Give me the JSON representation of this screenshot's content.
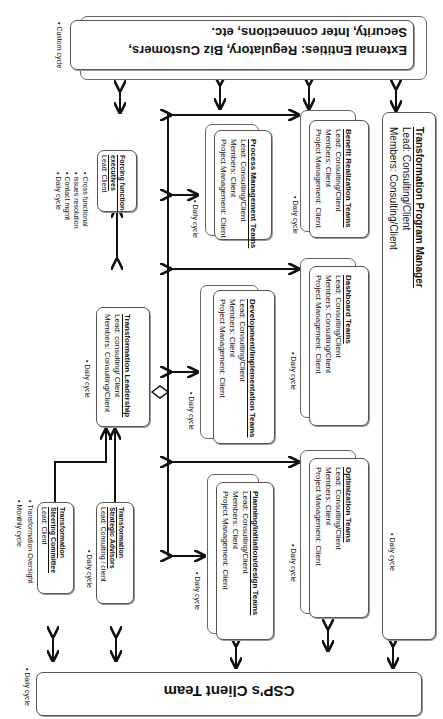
{
  "external": {
    "line1": "External Entities: Regulatory,  Biz Customers,",
    "line2": "Security, Inter connections, etc.",
    "cycle": "Custom cycle"
  },
  "client_team": {
    "title": "CSP's Client Team",
    "cycle": "Daily cycle"
  },
  "forcing": {
    "title1": "Forcing function-",
    "title2": "executives",
    "lead": "Lead: Client",
    "notes": [
      "Cross functional",
      "issues resolution",
      "Contact mgmt",
      "Daily cycle"
    ]
  },
  "leadership": {
    "title": "Transformation Leadership",
    "lead": "Lead: consulting/ Client",
    "members": "Members: Consulting/Client",
    "cycle": "Daily cycle"
  },
  "steering": {
    "title1": "Transformation",
    "title2": "Steering Committee",
    "lead": "Lead: Client",
    "notes": [
      "Transformation Oversight",
      "Monthly cycle"
    ]
  },
  "advisors": {
    "title1": "Transformation",
    "title2": "Strategic Advisors",
    "lead": "Lead: Consulting / client",
    "cycle": "Daily cycle"
  },
  "teams": [
    {
      "title": "Process Management  Teams",
      "lead": "Lead:  Consulting/Client",
      "members": "Members: Client",
      "pm": "Project Management: Client",
      "cycle": "Daily cycle"
    },
    {
      "title": "Development/Implementation Teams",
      "lead": "Lead:  Consulting/Client",
      "members": "Members: Client",
      "pm": "Project Management: Client",
      "cycle": "Daily cycle"
    },
    {
      "title": "Planning/initiation/design Teams",
      "lead": "Lead: Consulting/Client",
      "members": "Members: Client",
      "pm": "Project Management: Client",
      "cycle": "Daily cycle"
    },
    {
      "title": "Benefit Realization Teams",
      "lead": "Lead:  Consulting/Client",
      "members": "Members: Client",
      "pm": "Project Management: Client",
      "cycle": "Daily cycle"
    },
    {
      "title": "Dashboard Teams",
      "lead": "Lead: Consulting/Client",
      "members": "Members: Consulting/Client",
      "pm": "Project Management: Client",
      "cycle": "Daily cycle"
    },
    {
      "title": "Optimization Teams",
      "lead": "Lead:  Consulting/Client",
      "members": "Members: Client",
      "pm": "Project Management: Client",
      "cycle": "Daily cycle"
    }
  ],
  "program_manager": {
    "title": "Transformation Program Manager",
    "lead": "Lead: Consulting/Client",
    "members": "Members: Consulting/Client",
    "cycle": "Daily cycle"
  }
}
